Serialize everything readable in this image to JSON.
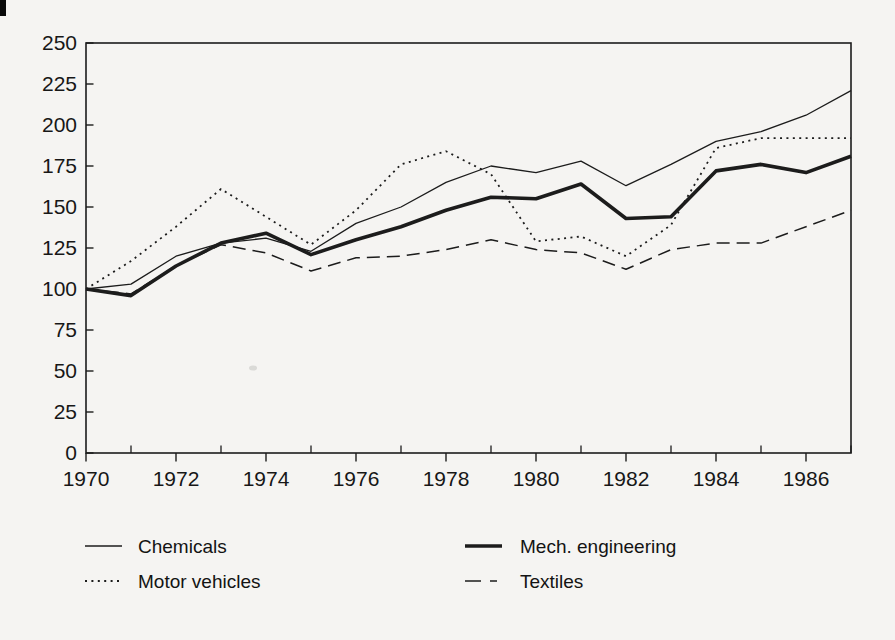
{
  "page": {
    "background_color": "#f5f4f2",
    "ink_color": "#1c1c1c"
  },
  "chart_data": {
    "type": "line",
    "title": "",
    "xlabel": "",
    "ylabel": "",
    "grid": false,
    "legend_position": "below",
    "x": [
      1970,
      1971,
      1972,
      1973,
      1974,
      1975,
      1976,
      1977,
      1978,
      1979,
      1980,
      1981,
      1982,
      1983,
      1984,
      1985,
      1986,
      1987
    ],
    "x_axis": {
      "range": [
        1970,
        1987
      ],
      "major_ticks": [
        1970,
        1972,
        1974,
        1976,
        1978,
        1980,
        1982,
        1984,
        1986
      ],
      "major_tick_labels": [
        "1970",
        "1972",
        "1974",
        "1976",
        "1978",
        "1980",
        "1982",
        "1984",
        "1986"
      ],
      "minor_ticks": [
        1971,
        1973,
        1975,
        1977,
        1979,
        1981,
        1983,
        1985,
        1987
      ]
    },
    "y_axis": {
      "range": [
        0,
        250
      ],
      "ticks": [
        0,
        25,
        50,
        75,
        100,
        125,
        150,
        175,
        200,
        225,
        250
      ],
      "tick_labels": [
        "0",
        "25",
        "50",
        "75",
        "100",
        "125",
        "150",
        "175",
        "200",
        "225",
        "250"
      ]
    },
    "series": [
      {
        "name": "Chemicals",
        "line_style": "thin-solid",
        "values": [
          100,
          103,
          120,
          128,
          131,
          123,
          140,
          150,
          165,
          175,
          171,
          178,
          163,
          176,
          190,
          196,
          206,
          221
        ]
      },
      {
        "name": "Motor vehicles",
        "line_style": "dotted",
        "values": [
          100,
          117,
          138,
          161,
          144,
          127,
          148,
          176,
          184,
          170,
          129,
          132,
          120,
          139,
          186,
          192,
          192,
          192
        ]
      },
      {
        "name": "Mech. engineering",
        "line_style": "thick-solid",
        "values": [
          100,
          96,
          114,
          128,
          134,
          121,
          130,
          138,
          148,
          156,
          155,
          164,
          143,
          144,
          172,
          176,
          171,
          181
        ]
      },
      {
        "name": "Textiles",
        "line_style": "dashed",
        "values": [
          100,
          97,
          114,
          127,
          122,
          111,
          119,
          120,
          124,
          130,
          124,
          122,
          112,
          124,
          128,
          128,
          138,
          148
        ]
      }
    ]
  }
}
